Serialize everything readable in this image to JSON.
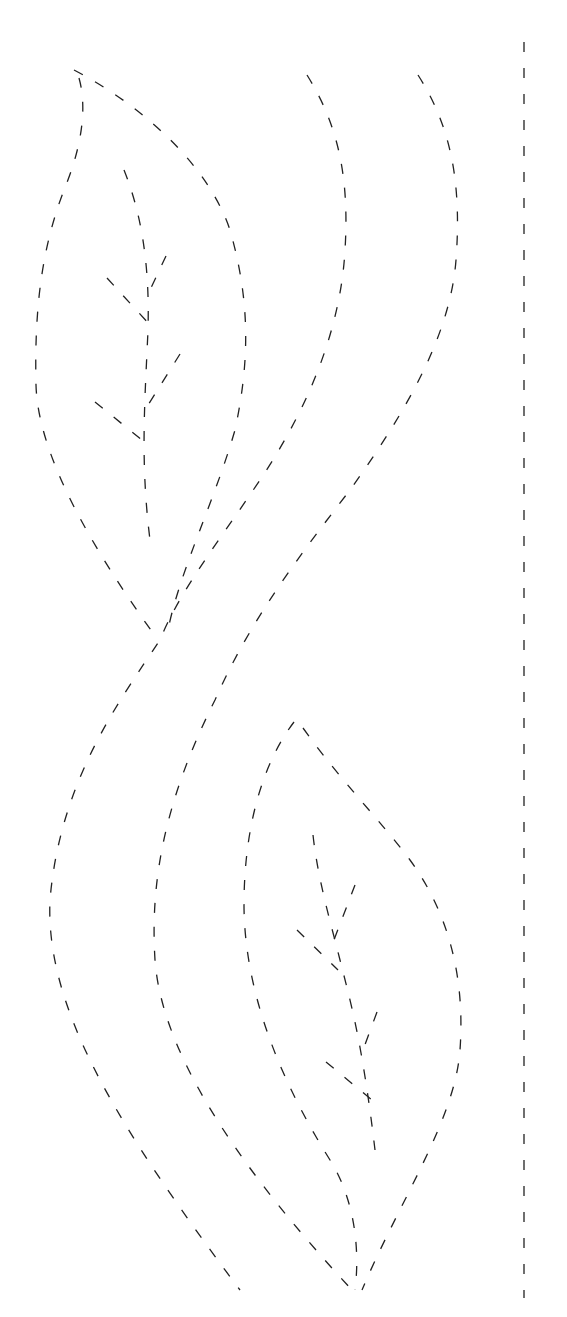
{
  "pattern": {
    "title": "",
    "background": "#ffffff",
    "stroke_color": "#222222",
    "stroke_width": 1.3,
    "dash": "10 14",
    "guide_dash": "10 16",
    "paths": [
      {
        "name": "guide-line-right",
        "d": "M524 42 L524 1298",
        "dash_key": "guide"
      },
      {
        "name": "upper-leaf-outline-left",
        "d": "M79 78 C88 110 80 150 66 185 C44 240 34 300 36 385 C38 460 100 560 158 640"
      },
      {
        "name": "upper-leaf-outline-right",
        "d": "M74 70 C150 110 210 170 230 230 C250 300 250 360 235 430 C215 500 180 570 168 630"
      },
      {
        "name": "upper-leaf-midrib",
        "d": "M124 170 C140 210 150 260 148 330 C145 400 140 460 150 540"
      },
      {
        "name": "upper-leaf-vein-1-left",
        "d": "M107 278 L150 325"
      },
      {
        "name": "upper-leaf-vein-1-right",
        "d": "M166 256 L150 290"
      },
      {
        "name": "upper-leaf-vein-2-left",
        "d": "M95 402 L142 440"
      },
      {
        "name": "upper-leaf-vein-2-right",
        "d": "M180 354 L145 410"
      },
      {
        "name": "stem-middle",
        "d": "M307 75 C335 120 350 170 345 250 C340 340 300 420 260 480 C220 540 180 590 160 640 C120 700 60 780 50 900 C45 1010 120 1130 240 1290"
      },
      {
        "name": "stem-right",
        "d": "M418 75 C450 125 462 180 456 260 C450 340 400 420 350 490 C300 555 250 620 215 700 C165 800 150 880 155 960 C162 1060 250 1180 352 1290"
      },
      {
        "name": "lower-leaf-outline-left",
        "d": "M294 722 C265 760 245 820 244 900 C243 990 280 1080 330 1160 C355 1200 360 1250 355 1290"
      },
      {
        "name": "lower-leaf-outline-right",
        "d": "M303 728 C340 780 380 820 410 860 C450 915 465 980 460 1050 C455 1120 400 1200 362 1290"
      },
      {
        "name": "lower-leaf-midrib",
        "d": "M313 835 C318 880 330 920 340 960 C350 1000 362 1040 375 1150"
      },
      {
        "name": "lower-leaf-vein-1-left",
        "d": "M297 930 L338 970"
      },
      {
        "name": "lower-leaf-vein-1-right",
        "d": "M355 885 L332 945"
      },
      {
        "name": "lower-leaf-vein-2-left",
        "d": "M326 1062 L372 1100"
      },
      {
        "name": "lower-leaf-vein-2-right",
        "d": "M377 1012 L363 1050"
      }
    ]
  }
}
